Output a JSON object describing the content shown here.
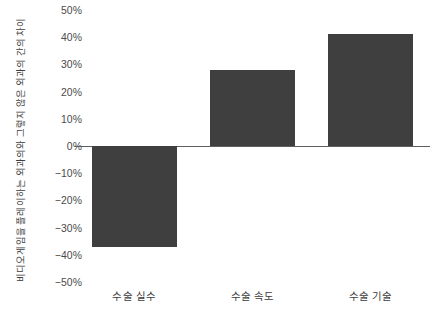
{
  "chart_data": {
    "type": "bar",
    "title": "",
    "subtitle": "",
    "xlabel": "",
    "ylabel": "비디오게임을 플레이하는 외과의와 그렇지 않은 외과의 간의 차이",
    "categories": [
      "수술 실수",
      "수술 속도",
      "수술 기술"
    ],
    "values": [
      -37,
      28,
      41
    ],
    "value_labels": [
      "-37%",
      "28%",
      "41%"
    ],
    "series": [
      {
        "name": "",
        "values": [
          -37,
          28,
          41
        ]
      }
    ],
    "ylim": [
      -50,
      50
    ],
    "ytick_values": [
      50,
      40,
      30,
      20,
      10,
      0,
      -10,
      -20,
      -30,
      -40,
      -50
    ],
    "ytick_labels": [
      "50%",
      "40%",
      "30%",
      "20%",
      "10%",
      "0%",
      "−10%",
      "−20%",
      "−30%",
      "−40%",
      "−50%"
    ],
    "grid": false,
    "legend": false,
    "legend_position": "none",
    "bar_color": "#3f3f3f",
    "zero_line_color": "#5e5e5e",
    "background_color": "#ffffff",
    "tick_label_color": "#4a4a4a",
    "axis_title_color": "#3d3d3d"
  }
}
